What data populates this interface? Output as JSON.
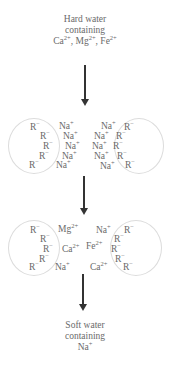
{
  "top_label": {
    "line1": "Hard water",
    "line2": "containing",
    "ions": [
      {
        "base": "Ca",
        "charge": "2+"
      },
      {
        "base": "Mg",
        "charge": "2+"
      },
      {
        "base": "Fe",
        "charge": "2+"
      }
    ],
    "separator": ", "
  },
  "stage1": {
    "left_resin": [
      "R",
      "R",
      "R",
      "R",
      "R"
    ],
    "left_resin_charge": "−",
    "left_na": [
      "Na",
      "Na",
      "Na",
      "Na",
      "Na"
    ],
    "right_na": [
      "Na",
      "Na",
      "Na",
      "Na",
      "Na"
    ],
    "right_resin": [
      "R",
      "R",
      "R",
      "R",
      "R"
    ],
    "na_charge": "+"
  },
  "stage2": {
    "left_resin": [
      "R",
      "R",
      "R",
      "R",
      "R"
    ],
    "resin_charge": "−",
    "cations": [
      {
        "base": "Mg",
        "charge": "2+"
      },
      {
        "base": "Na",
        "charge": "+"
      },
      {
        "base": "Ca",
        "charge": "2+"
      },
      {
        "base": "Fe",
        "charge": "2+"
      },
      {
        "base": "Na",
        "charge": "+"
      },
      {
        "base": "Ca",
        "charge": "2+"
      }
    ],
    "right_resin": [
      "R",
      "R",
      "R",
      "R",
      "R"
    ]
  },
  "bottom_label": {
    "line1": "Soft water",
    "line2": "containing",
    "ion": {
      "base": "Na",
      "charge": "+"
    }
  }
}
